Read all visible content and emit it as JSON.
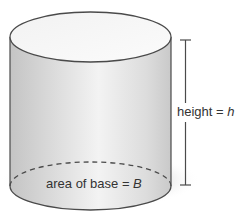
{
  "figure": {
    "shape": "cylinder",
    "height_label": {
      "text": "height = ",
      "var": "h"
    },
    "base_label": {
      "text": "area of base = ",
      "var": "B"
    }
  },
  "colors": {
    "outline": "#4a4a4a",
    "body_light": "#f4f4f4",
    "body_dark": "#c8c8c8",
    "top_face": "#f7f7f7",
    "shadow": "#b5b5b5",
    "text": "#333333"
  }
}
